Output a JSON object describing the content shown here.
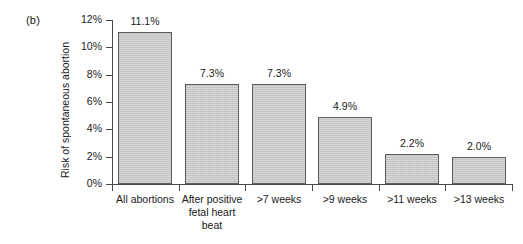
{
  "figure": {
    "panel_label": "(b)",
    "y_axis_title": "Risk of spontaneous abortion"
  },
  "chart_data": {
    "type": "bar",
    "title": "",
    "subtitle": "",
    "panel": "(b)",
    "xlabel": "",
    "ylabel": "Risk of spontaneous abortion",
    "categories": [
      "All abortions",
      "After positive\nfetal heart\nbeat",
      ">7 weeks",
      ">9 weeks",
      ">11 weeks",
      ">13 weeks"
    ],
    "values": [
      11.1,
      7.3,
      7.3,
      4.9,
      2.2,
      2.0
    ],
    "data_labels": [
      "11.1%",
      "7.3%",
      "7.3%",
      "4.9%",
      "2.2%",
      "2.0%"
    ],
    "ylim": [
      0,
      12
    ],
    "ytick_values": [
      0,
      2,
      4,
      6,
      8,
      10,
      12
    ],
    "ytick_labels": [
      "0%",
      "2%",
      "4%",
      "6%",
      "8%",
      "10%",
      "12%"
    ],
    "grid": false,
    "legend": null,
    "bar_color": "#c9c9c9",
    "bar_edge_color": "#5c5c5c",
    "axis_color": "#4a4a4a",
    "background_color": "#ffffff"
  }
}
